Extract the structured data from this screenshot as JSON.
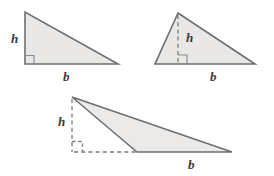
{
  "figure": {
    "kind": "geometry-diagram",
    "background_color": "#ffffff",
    "fill_color": "#e9e8e6",
    "stroke_color": "#6e6e6e",
    "dash_color": "#7a7a7a",
    "label_color": "#3b3b3b",
    "width": 274,
    "height": 176
  },
  "triangles": [
    {
      "id": "right-triangle",
      "name": "Right triangle",
      "height_label": "h",
      "base_label": "b",
      "height_style": "solid-side",
      "has_right_angle_mark": true,
      "vertices": [
        [
          25,
          12
        ],
        [
          25,
          64
        ],
        [
          118,
          64
        ]
      ],
      "height_label_pos": [
        11,
        43
      ],
      "base_label_pos": [
        63,
        81
      ]
    },
    {
      "id": "acute-triangle",
      "name": "Acute triangle",
      "height_label": "h",
      "base_label": "b",
      "height_style": "interior-dashed",
      "has_right_angle_mark": true,
      "vertices": [
        [
          178,
          13
        ],
        [
          155,
          64
        ],
        [
          255,
          64
        ]
      ],
      "height_foot": [
        178,
        64
      ],
      "height_label_pos": [
        186,
        42
      ],
      "base_label_pos": [
        210,
        81
      ]
    },
    {
      "id": "obtuse-triangle",
      "name": "Obtuse triangle",
      "height_label": "h",
      "base_label": "b",
      "height_style": "exterior-dashed",
      "has_right_angle_mark": true,
      "vertices": [
        [
          72,
          97
        ],
        [
          137,
          152
        ],
        [
          232,
          152
        ]
      ],
      "height_foot": [
        72,
        152
      ],
      "base_extension_end": [
        137,
        152
      ],
      "height_label_pos": [
        58,
        126
      ],
      "base_label_pos": [
        188,
        169
      ]
    }
  ],
  "labels": {
    "height_symbol": "h",
    "base_symbol": "b"
  }
}
